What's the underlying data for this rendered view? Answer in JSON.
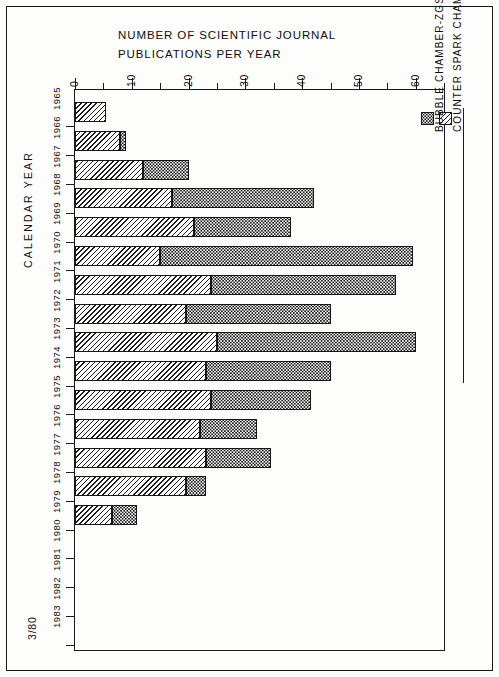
{
  "figure": {
    "title_line_1": "NUMBER OF SCIENTIFIC JOURNAL",
    "title_line_2": "PUBLICATIONS PER YEAR",
    "category_axis_title": "CALENDAR  YEAR",
    "footnote": "3/80"
  },
  "legend": {
    "entries": [
      {
        "label": "COUNTER SPARK CHAMBER-ZGS",
        "pattern": "diagonal-hatch"
      },
      {
        "label": "BUBBLE CHAMBER-ZGS",
        "pattern": "stipple-dots"
      }
    ]
  },
  "value_axis": {
    "labels": [
      "0",
      "10",
      "20",
      "30",
      "40",
      "50",
      "60"
    ],
    "min": 0,
    "max": 65,
    "major_step": 10,
    "minor_step": 5
  },
  "chart_data": {
    "type": "bar",
    "orientation": "horizontal-stacked",
    "title": "NUMBER OF SCIENTIFIC JOURNAL PUBLICATIONS PER YEAR",
    "xlabel": "NUMBER OF SCIENTIFIC JOURNAL PUBLICATIONS PER YEAR",
    "ylabel": "CALENDAR  YEAR",
    "xlim": [
      0,
      65
    ],
    "grid": false,
    "legend_position": "right",
    "categories": [
      "1965",
      "1966",
      "1967",
      "1968",
      "1969",
      "1970",
      "1971",
      "1972",
      "1973",
      "1974",
      "1975",
      "1976",
      "1977",
      "1978",
      "1979",
      "1980",
      "1981",
      "1982",
      "1983"
    ],
    "series": [
      {
        "name": "COUNTER SPARK CHAMBER-ZGS",
        "pattern": "diagonal-hatch",
        "values": [
          5.5,
          8,
          12,
          17,
          21,
          15,
          24,
          19.5,
          25,
          23,
          24,
          22,
          23,
          19.5,
          6.5,
          0,
          0,
          0,
          0
        ]
      },
      {
        "name": "BUBBLE CHAMBER-ZGS",
        "pattern": "stipple-dots",
        "values": [
          0,
          1,
          8,
          25,
          17,
          44.5,
          32.5,
          25.5,
          35,
          22,
          17.5,
          10,
          11.5,
          3.5,
          4.5,
          0,
          0,
          0,
          0
        ]
      }
    ],
    "totals": [
      5.5,
      9,
      20,
      42,
      38,
      59.5,
      56.5,
      45,
      60,
      45,
      41.5,
      32,
      34.5,
      23,
      11,
      0,
      0,
      0,
      0
    ]
  }
}
